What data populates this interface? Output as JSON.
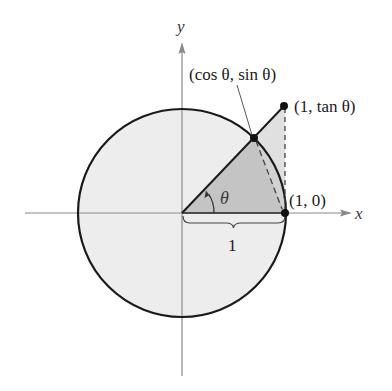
{
  "diagram": {
    "type": "unit circle with angle, sector, and tangent triangle",
    "axes": {
      "x_label": "x",
      "y_label": "y"
    },
    "angle_label": "θ",
    "radius_label": "1",
    "points": {
      "origin": {
        "x": 182,
        "y": 213
      },
      "cos_sin": {
        "label": "(cos θ, sin θ)",
        "x": 254,
        "y": 138
      },
      "one_tan": {
        "label": "(1, tan θ)",
        "x": 284,
        "y": 106
      },
      "one_zero": {
        "label": "(1, 0)",
        "x": 285,
        "y": 213
      }
    },
    "circle": {
      "cx": 182,
      "cy": 213,
      "r": 104
    },
    "colors": {
      "circle_fill": "#ededed",
      "tan_triangle_fill": "#e0e0e0",
      "sector_segment_fill": "#d2d2d2",
      "inner_triangle_fill": "#c4c4c4",
      "stroke": "#1a1a1a",
      "axis": "#8a8a8a"
    }
  }
}
